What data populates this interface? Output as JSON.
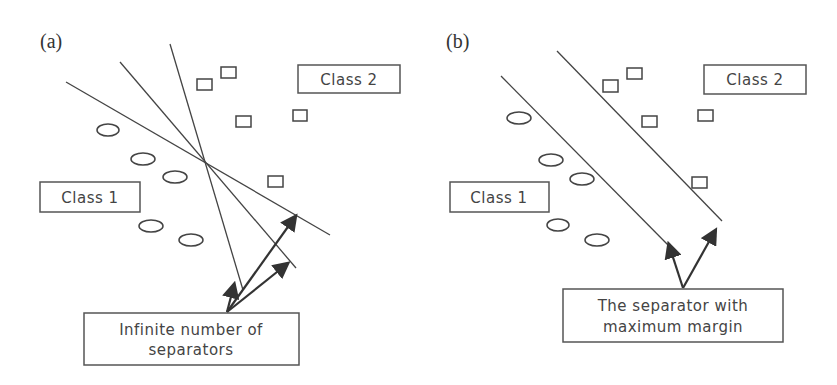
{
  "panel_a": {
    "label": "(a)",
    "class2_label": "Class 2",
    "class1_label": "Class 1",
    "caption_line1": "Infinite number of",
    "caption_line2": "separators"
  },
  "panel_b": {
    "label": "(b)",
    "class2_label": "Class 2",
    "class1_label": "Class 1",
    "caption_line1": "The separator with",
    "caption_line2": "maximum margin"
  },
  "colors": {
    "ink": "#444444",
    "background": "#ffffff"
  }
}
